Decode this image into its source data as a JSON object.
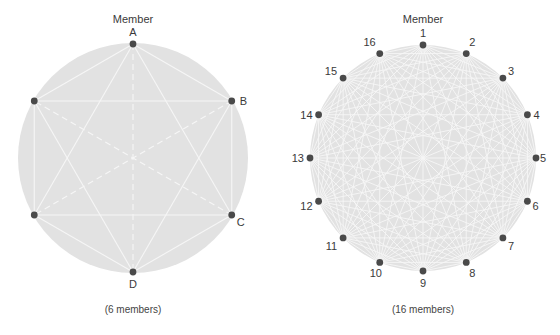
{
  "colors": {
    "disk": "#e2e2e2",
    "line": "#f6f6f6",
    "node": "#4a4a4a",
    "text": "#3a3a3a"
  },
  "diagrams": [
    {
      "id": "six",
      "header": "Member",
      "caption": "(6 members)",
      "count": 6,
      "center": [
        133,
        158
      ],
      "radius": 114,
      "disk_radius": 115,
      "dashed": true,
      "labels": [
        {
          "index": 0,
          "text": "A",
          "dx": 0,
          "dy": -8,
          "anchor": "middle"
        },
        {
          "index": 1,
          "text": "B",
          "dx": 8,
          "dy": 4,
          "anchor": "start"
        },
        {
          "index": 2,
          "text": "C",
          "dx": 5,
          "dy": 11,
          "anchor": "start"
        },
        {
          "index": 3,
          "text": "D",
          "dx": 0,
          "dy": 16,
          "anchor": "middle"
        }
      ]
    },
    {
      "id": "sixteen",
      "header": "Member",
      "caption": "(16 members)",
      "count": 16,
      "center": [
        423,
        158
      ],
      "radius": 113,
      "disk_radius": 113,
      "dashed": false,
      "labels": [
        {
          "index": 0,
          "text": "1",
          "dx": 0,
          "dy": -8,
          "anchor": "middle"
        },
        {
          "index": 1,
          "text": "2",
          "dx": 3,
          "dy": -8,
          "anchor": "start"
        },
        {
          "index": 2,
          "text": "3",
          "dx": 5,
          "dy": -3,
          "anchor": "start"
        },
        {
          "index": 3,
          "text": "4",
          "dx": 6,
          "dy": 4,
          "anchor": "start"
        },
        {
          "index": 4,
          "text": "5",
          "dx": 4,
          "dy": 4,
          "anchor": "start"
        },
        {
          "index": 5,
          "text": "6",
          "dx": 5,
          "dy": 9,
          "anchor": "start"
        },
        {
          "index": 6,
          "text": "7",
          "dx": 5,
          "dy": 12,
          "anchor": "start"
        },
        {
          "index": 7,
          "text": "8",
          "dx": 3,
          "dy": 15,
          "anchor": "start"
        },
        {
          "index": 8,
          "text": "9",
          "dx": 0,
          "dy": 16,
          "anchor": "middle"
        },
        {
          "index": 9,
          "text": "10",
          "dx": -4,
          "dy": 15,
          "anchor": "middle"
        },
        {
          "index": 10,
          "text": "11",
          "dx": -6,
          "dy": 12,
          "anchor": "end"
        },
        {
          "index": 11,
          "text": "12",
          "dx": -6,
          "dy": 9,
          "anchor": "end"
        },
        {
          "index": 12,
          "text": "13",
          "dx": -6,
          "dy": 4,
          "anchor": "end"
        },
        {
          "index": 13,
          "text": "14",
          "dx": -6,
          "dy": 4,
          "anchor": "end"
        },
        {
          "index": 14,
          "text": "15",
          "dx": -6,
          "dy": -3,
          "anchor": "end"
        },
        {
          "index": 15,
          "text": "16",
          "dx": -4,
          "dy": -8,
          "anchor": "end"
        }
      ]
    }
  ]
}
